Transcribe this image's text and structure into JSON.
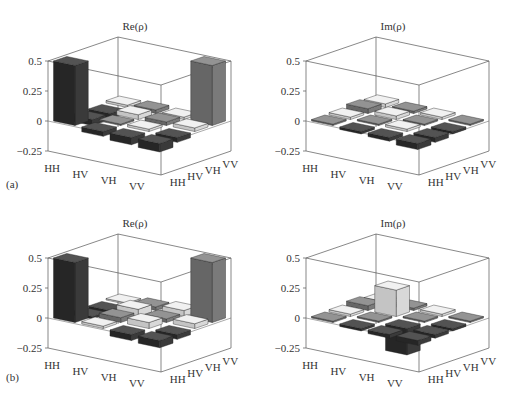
{
  "chart_data": [
    {
      "id": "a-re",
      "type": "bar3d",
      "panel_label": "",
      "title": "Re(ρ)",
      "zticks": [
        "0.5",
        "0.25",
        "0",
        "−0.25"
      ],
      "zlim": [
        -0.25,
        0.5
      ],
      "row_labels": [
        "HH",
        "HV",
        "VH",
        "VV"
      ],
      "col_labels": [
        "HH",
        "HV",
        "VH",
        "VV"
      ],
      "values": [
        [
          0.5,
          -0.05,
          -0.04,
          0.02
        ],
        [
          -0.04,
          0.01,
          0.04,
          0.03
        ],
        [
          -0.06,
          0.02,
          0.03,
          0.02
        ],
        [
          -0.07,
          -0.04,
          0.03,
          0.5
        ]
      ]
    },
    {
      "id": "a-im",
      "type": "bar3d",
      "panel_label": "",
      "title": "Im(ρ)",
      "zticks": [
        "0.5",
        "0.25",
        "0",
        "−0.25"
      ],
      "zlim": [
        -0.25,
        0.5
      ],
      "row_labels": [
        "HH",
        "HV",
        "VH",
        "VV"
      ],
      "col_labels": [
        "HH",
        "HV",
        "VH",
        "VV"
      ],
      "values": [
        [
          0.0,
          0.02,
          0.04,
          0.03
        ],
        [
          -0.02,
          0.0,
          0.03,
          0.02
        ],
        [
          -0.03,
          0.02,
          0.0,
          0.02
        ],
        [
          -0.05,
          -0.04,
          -0.02,
          0.0
        ]
      ]
    },
    {
      "id": "b-re",
      "type": "bar3d",
      "panel_label": "",
      "title": "Re(ρ)",
      "zticks": [
        "0.5",
        "0.25",
        "0",
        "−0.25"
      ],
      "zlim": [
        -0.25,
        0.5
      ],
      "row_labels": [
        "HH",
        "HV",
        "VH",
        "VV"
      ],
      "col_labels": [
        "HH",
        "HV",
        "VH",
        "VV"
      ],
      "values": [
        [
          0.5,
          -0.02,
          -0.03,
          0.01
        ],
        [
          0.02,
          0.04,
          0.06,
          0.03
        ],
        [
          -0.05,
          0.05,
          0.03,
          0.05
        ],
        [
          -0.06,
          -0.04,
          0.04,
          0.5
        ]
      ]
    },
    {
      "id": "b-im",
      "type": "bar3d",
      "panel_label": "",
      "title": "Im(ρ)",
      "zticks": [
        "0.5",
        "0.25",
        "0",
        "−0.25"
      ],
      "zlim": [
        -0.25,
        0.5
      ],
      "row_labels": [
        "HH",
        "HV",
        "VH",
        "VV"
      ],
      "col_labels": [
        "HH",
        "HV",
        "VH",
        "VV"
      ],
      "values": [
        [
          0.0,
          0.02,
          0.04,
          0.02
        ],
        [
          -0.02,
          0.0,
          0.22,
          0.02
        ],
        [
          -0.03,
          -0.22,
          0.0,
          0.02
        ],
        [
          -0.04,
          -0.03,
          -0.02,
          0.0
        ]
      ]
    }
  ],
  "panel_labels": {
    "a": "(a)",
    "b": "(b)"
  },
  "colors": {
    "axis": "#555555",
    "bar_dark": "#3a3a3a",
    "bar_mid": "#7a7a7a",
    "bar_light": "#d8d8d8"
  }
}
